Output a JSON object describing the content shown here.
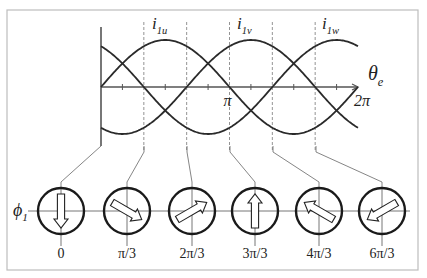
{
  "frame": {
    "border_color": "#bdbdbd",
    "left": 7,
    "top": 10,
    "right": 418,
    "bottom": 270
  },
  "waveform": {
    "origin_x": 101,
    "axis_y": 87,
    "period_px": 257,
    "amplitude_px": 47,
    "y_axis_top": 27,
    "y_axis_bottom": 146,
    "dashed_top": 22,
    "dashed_bottom": 152,
    "curve_color": "#2a2a2a",
    "axis_color": "#555555",
    "dash_color": "#777777",
    "x_axis_label": {
      "base": "θ",
      "sub": "e"
    },
    "tick_labels": [
      {
        "text": "π",
        "at": 0.5
      },
      {
        "text": "2π",
        "at": 1.0
      }
    ],
    "currents": [
      {
        "name": "i",
        "sub": "1u",
        "phase_deg": 0,
        "label_x": 152
      },
      {
        "name": "i",
        "sub": "1v",
        "phase_deg": 120,
        "label_x": 237
      },
      {
        "name": "i",
        "sub": "1w",
        "phase_deg": 240,
        "label_x": 322
      }
    ]
  },
  "flux_axis_label": {
    "base": "ϕ",
    "sub": "1"
  },
  "phasors": {
    "center_y": 211,
    "radius": 23,
    "axis_line_y": 211,
    "axis_line_x1": 28,
    "axis_line_x2": 410,
    "items": [
      {
        "label": "0",
        "cx": 61,
        "arrow_angle_deg": -90,
        "src_x": 101,
        "knee_y": 146
      },
      {
        "label": "π/3",
        "cx": 127,
        "arrow_angle_deg": -30,
        "src_x": 144,
        "knee_y": 152
      },
      {
        "label": "2π/3",
        "cx": 192,
        "arrow_angle_deg": 30,
        "src_x": 187,
        "knee_y": 152
      },
      {
        "label": "3π/3",
        "cx": 255,
        "arrow_angle_deg": 90,
        "src_x": 230,
        "knee_y": 152
      },
      {
        "label": "4π/3",
        "cx": 319,
        "arrow_angle_deg": 150,
        "src_x": 273,
        "knee_y": 152
      },
      {
        "label": "6π/3",
        "cx": 382,
        "arrow_angle_deg": 210,
        "src_x": 316,
        "knee_y": 152
      }
    ]
  }
}
